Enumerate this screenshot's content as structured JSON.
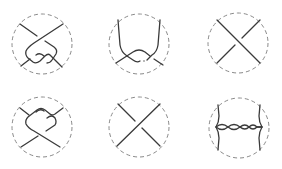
{
  "figure": {
    "type": "tangle-diagrams",
    "layout": {
      "rows": 2,
      "cols": 3
    },
    "colors": {
      "circle": "#8a8a8a",
      "strand": "#3a3a3a",
      "background": "#ffffff"
    },
    "diagrams": [
      {
        "id": "d1",
        "row": 1,
        "col": 1,
        "description": "tangle with a twisted loop, two crossings in lower half"
      },
      {
        "id": "d2",
        "row": 1,
        "col": 2,
        "description": "two vertical arcs from top joining into a crossing pair near bottom"
      },
      {
        "id": "d3",
        "row": 1,
        "col": 3,
        "description": "single crossing, top-left to bottom-right strand over"
      },
      {
        "id": "d4",
        "row": 2,
        "col": 1,
        "description": "tangle with a twisted loop, two crossings in upper half"
      },
      {
        "id": "d5",
        "row": 2,
        "col": 2,
        "description": "single crossing, bottom-left to top-right strand over"
      },
      {
        "id": "d6",
        "row": 2,
        "col": 3,
        "description": "horizontal twisted band of several crossings between two vertical arcs"
      }
    ]
  }
}
